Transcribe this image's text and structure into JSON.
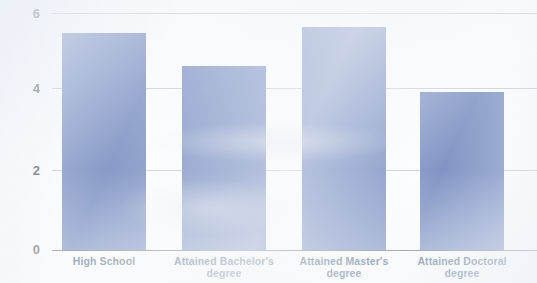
{
  "chart_data": {
    "type": "bar",
    "title": "",
    "subtitle": "",
    "xlabel": "",
    "ylabel": "",
    "categories": [
      "High School",
      "Attained Bachelor's degree",
      "Attained Master's degree",
      "Attained Doctoral degree"
    ],
    "values": [
      5.5,
      4.65,
      5.65,
      4.0
    ],
    "ylim": [
      0,
      6
    ],
    "yticks": [
      0,
      2,
      4,
      6
    ],
    "ytick_labels": [
      "0",
      "2",
      "4",
      "6"
    ],
    "grid": true,
    "legend": false,
    "legend_position": "none",
    "bar_color": "#4f6bae",
    "gridline_color": "#b9bec6",
    "axis_color": "#4a4a4a",
    "tick_label_color": "#1d1d1d",
    "category_label_color": "#17365d",
    "background_color": "#fbfcfd"
  },
  "axis": {
    "y_ticks": [
      {
        "label": "6",
        "value": 6
      },
      {
        "label": "4",
        "value": 4
      },
      {
        "label": "2",
        "value": 2
      },
      {
        "label": "0",
        "value": 0
      }
    ]
  },
  "bars": [
    {
      "label": "High School",
      "label_line1": "High School",
      "label_line2": "",
      "value": 5.5
    },
    {
      "label": "Attained Bachelor's degree",
      "label_line1": "Attained Bachelor's",
      "label_line2": "degree",
      "value": 4.65
    },
    {
      "label": "Attained Master's degree",
      "label_line1": "Attained Master's",
      "label_line2": "degree",
      "value": 5.65
    },
    {
      "label": "Attained Doctoral degree",
      "label_line1": "Attained Doctoral",
      "label_line2": "degree",
      "value": 4.0
    }
  ]
}
